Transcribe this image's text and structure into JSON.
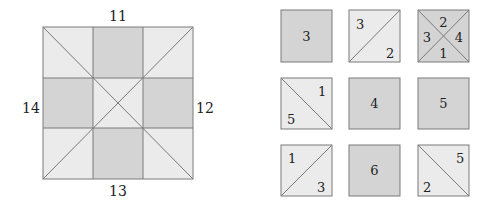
{
  "colors": {
    "light": "#ebebeb",
    "dark": "#d3d3d3",
    "stroke": "#777777",
    "text": "#222222"
  },
  "big_square": {
    "labels": {
      "top": "11",
      "right": "12",
      "bottom": "13",
      "left": "14"
    },
    "grid": "3x3",
    "dark_cells": [
      "top-middle",
      "middle-left",
      "middle-right",
      "bottom-middle"
    ],
    "diagonals": true
  },
  "tiles": [
    {
      "row": 0,
      "col": 0,
      "type": "solid",
      "color": "dark",
      "labels": {
        "center": "3"
      }
    },
    {
      "row": 0,
      "col": 1,
      "type": "diag-up",
      "color": "light",
      "labels": {
        "top_left": "3",
        "bottom_right": "2"
      }
    },
    {
      "row": 0,
      "col": 2,
      "type": "x-split",
      "color": "dark",
      "labels": {
        "top": "2",
        "right": "4",
        "bottom": "1",
        "left": "3"
      }
    },
    {
      "row": 1,
      "col": 0,
      "type": "diag-down",
      "color": "light",
      "labels": {
        "top_right": "1",
        "bottom_left": "5"
      }
    },
    {
      "row": 1,
      "col": 1,
      "type": "solid",
      "color": "dark",
      "labels": {
        "center": "4"
      }
    },
    {
      "row": 1,
      "col": 2,
      "type": "solid",
      "color": "dark",
      "labels": {
        "center": "5"
      }
    },
    {
      "row": 2,
      "col": 0,
      "type": "diag-up",
      "color": "light",
      "labels": {
        "top_left": "1",
        "bottom_right": "3"
      }
    },
    {
      "row": 2,
      "col": 1,
      "type": "solid",
      "color": "dark",
      "labels": {
        "center": "6"
      }
    },
    {
      "row": 2,
      "col": 2,
      "type": "diag-down",
      "color": "light",
      "labels": {
        "top_right": "5",
        "bottom_left": "2"
      }
    }
  ]
}
